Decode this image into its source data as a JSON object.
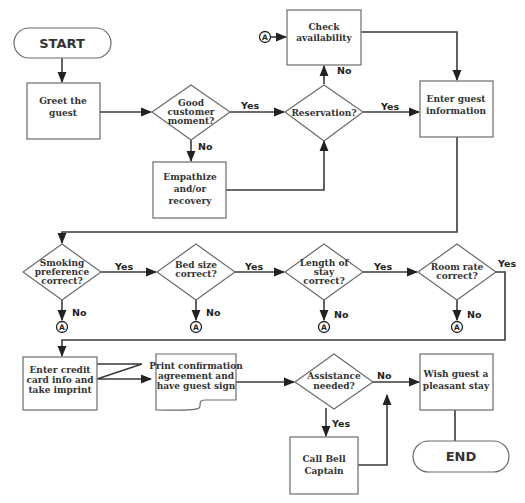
{
  "diagram": {
    "type": "flowchart",
    "terminals": {
      "start": "START",
      "end": "END"
    },
    "processes": {
      "greet": [
        "Greet the",
        "guest"
      ],
      "empathize": [
        "Empathize",
        "and/or",
        "recovery"
      ],
      "check_availability": [
        "Check",
        "availability"
      ],
      "enter_guest_info": [
        "Enter guest",
        "information"
      ],
      "enter_credit": [
        "Enter credit",
        "card info and",
        "take imprint"
      ],
      "print_confirmation": [
        "Print confirmation",
        "agreement and",
        "have guest sign"
      ],
      "wish_guest": [
        "Wish guest a",
        "pleasant stay"
      ],
      "call_bell_captain": [
        "Call Bell",
        "Captain"
      ]
    },
    "decisions": {
      "good_moment": [
        "Good",
        "customer",
        "moment?"
      ],
      "reservation": [
        "Reservation?"
      ],
      "smoking": [
        "Smoking",
        "preference",
        "correct?"
      ],
      "bed_size": [
        "Bed size",
        "correct?"
      ],
      "length_of_stay": [
        "Length of",
        "stay",
        "correct?"
      ],
      "room_rate": [
        "Room rate",
        "correct?"
      ],
      "assistance": [
        "Assistance",
        "needed?"
      ]
    },
    "labels": {
      "yes": "Yes",
      "no": "No"
    },
    "connector": "A",
    "colors": {
      "shape_stroke": "#6b6b6b",
      "line": "#3a3a3a",
      "text": "#333333",
      "background": "#ffffff"
    }
  }
}
